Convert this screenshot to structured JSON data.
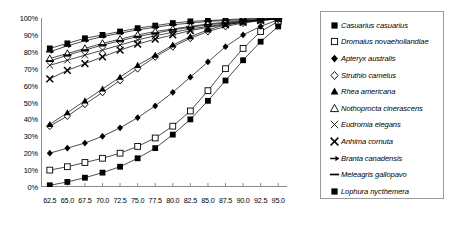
{
  "chart_data": {
    "type": "line",
    "title": "",
    "xlabel": "",
    "ylabel": "",
    "xlim": [
      61.25,
      96.25
    ],
    "ylim": [
      0,
      100
    ],
    "grid": false,
    "legend_position": "right",
    "x": [
      62.5,
      65.0,
      67.5,
      70.0,
      72.5,
      75.0,
      77.5,
      80.0,
      82.5,
      85.0,
      87.5,
      90.0,
      92.5,
      95.0
    ],
    "xtick_labels": [
      "62.5",
      "65.0",
      "67.5",
      "70.0",
      "72.5",
      "75.0",
      "77.5",
      "80.0",
      "82.5",
      "85.0",
      "87.5",
      "90.0",
      "92.5",
      "95.0"
    ],
    "ytick_labels": [
      "0%",
      "10%",
      "20%",
      "30%",
      "40%",
      "50%",
      "60%",
      "70%",
      "80%",
      "90%",
      "100%"
    ],
    "ytick_values": [
      0,
      10,
      20,
      30,
      40,
      50,
      60,
      70,
      80,
      90,
      100
    ],
    "series": [
      {
        "name": "Casuarius casuarius",
        "marker": "filled-square",
        "values": [
          82,
          85,
          88,
          90,
          92,
          94,
          95.5,
          97,
          98,
          98.5,
          99,
          99.5,
          100,
          100
        ]
      },
      {
        "name": "Dromaius novaehollandiae",
        "marker": "open-square",
        "values": [
          10,
          12,
          14.5,
          17,
          20,
          24,
          29,
          36,
          45,
          57,
          70,
          82,
          92,
          98
        ]
      },
      {
        "name": "Apteryx australis",
        "marker": "filled-diamond",
        "values": [
          20,
          23,
          26,
          30,
          35,
          41,
          48,
          56,
          65,
          74,
          83,
          90,
          95,
          99
        ]
      },
      {
        "name": "Struthio camelus",
        "marker": "open-diamond",
        "values": [
          36,
          42,
          49,
          56,
          63,
          70,
          77,
          83,
          88,
          92,
          95,
          97,
          98.5,
          99.5
        ]
      },
      {
        "name": "Rhea americana",
        "marker": "filled-triangle",
        "values": [
          37,
          44,
          51,
          58,
          65,
          72,
          78,
          84,
          89,
          93,
          96,
          97.5,
          99,
          99.5
        ]
      },
      {
        "name": "Nothoprocta cinerascens",
        "marker": "open-triangle",
        "values": [
          76,
          79,
          82,
          85,
          87.5,
          90,
          92,
          93.5,
          95,
          96.5,
          97.5,
          98.5,
          99,
          100
        ]
      },
      {
        "name": "Eudromia elegans",
        "marker": "x-thin",
        "values": [
          72,
          75,
          78,
          81,
          84,
          87,
          89.5,
          91.5,
          93.5,
          95,
          96.5,
          98,
          99,
          99.5
        ]
      },
      {
        "name": "Anhima cornuta",
        "marker": "x-bold",
        "values": [
          64,
          69,
          73,
          77,
          81,
          84.5,
          87.5,
          90,
          92.5,
          94.5,
          96,
          97.5,
          98.5,
          99.5
        ]
      },
      {
        "name": "Branta canadensis",
        "marker": "dash-arrow",
        "values": [
          80,
          83.5,
          86.5,
          89,
          91,
          93,
          94.5,
          96,
          97,
          98,
          98.5,
          99,
          99.5,
          100
        ]
      },
      {
        "name": "Meleagris gallopavo",
        "marker": "dash",
        "values": [
          74.5,
          78,
          81,
          84,
          86.5,
          89,
          91,
          93,
          94.5,
          96,
          97,
          98,
          99,
          99.5
        ]
      },
      {
        "name": "Lophura nycthemera",
        "marker": "filled-square",
        "values": [
          1,
          3,
          5.5,
          8.5,
          12,
          17,
          23,
          31,
          40,
          51,
          63,
          75,
          86,
          95
        ]
      }
    ]
  },
  "legend": {
    "items": [
      {
        "label": "Casuarius casuarius",
        "marker": "filled-square"
      },
      {
        "label": "Dromaius novaehollandiae",
        "marker": "open-square"
      },
      {
        "label": "Apteryx australis",
        "marker": "filled-diamond"
      },
      {
        "label": "Struthio camelus",
        "marker": "open-diamond"
      },
      {
        "label": "Rhea americana",
        "marker": "filled-triangle"
      },
      {
        "label": "Nothoprocta cinerascens",
        "marker": "open-triangle"
      },
      {
        "label": "Eudromia elegans",
        "marker": "x-thin"
      },
      {
        "label": "Anhima cornuta",
        "marker": "x-bold"
      },
      {
        "label": "Branta canadensis",
        "marker": "dash-arrow"
      },
      {
        "label": "Meleagris gallopavo",
        "marker": "dash"
      },
      {
        "label": "Lophura nycthemera",
        "marker": "filled-square"
      }
    ]
  },
  "colors": {
    "line": "#000000",
    "axis": "#8c8c8c",
    "text": "#000000",
    "legend_border": "#9a9a9a",
    "background": "#ffffff"
  }
}
